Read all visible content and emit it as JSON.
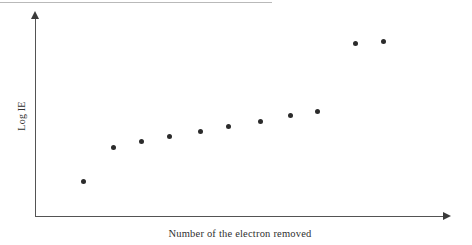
{
  "figure": {
    "top_rule_present": true,
    "background_color": "#ffffff",
    "axis_color": "#545454",
    "marker_color": "#2b2b2b"
  },
  "axes": {
    "y_label": "Log IE",
    "x_label": "Number of the electron removed",
    "y_axis_name": "vertical-axis",
    "x_axis_name": "horizontal-axis",
    "arrow_y": "y-axis-arrow",
    "arrow_x": "x-axis-arrow"
  },
  "chart_data": {
    "type": "scatter",
    "title": "",
    "subtitle": "",
    "xlabel": "Number of the electron removed",
    "ylabel": "Log IE",
    "grid": false,
    "legend": null,
    "xlim": [
      0,
      12
    ],
    "ylim": [
      0,
      10
    ],
    "x_tick_labels": [],
    "y_tick_labels": [],
    "annotations": [],
    "series": [
      {
        "name": "Log IE vs electron removed",
        "x": [
          1,
          2,
          3,
          4,
          5,
          6,
          7,
          8,
          9,
          10,
          11
        ],
        "y": [
          1.75,
          3.47,
          3.77,
          4.02,
          4.29,
          4.54,
          4.8,
          5.1,
          5.3,
          8.75,
          8.85
        ],
        "px": [
          {
            "cx": 83,
            "cy": 181
          },
          {
            "cx": 113,
            "cy": 147
          },
          {
            "cx": 141,
            "cy": 141
          },
          {
            "cx": 169,
            "cy": 136
          },
          {
            "cx": 200,
            "cy": 131
          },
          {
            "cx": 228,
            "cy": 126
          },
          {
            "cx": 260,
            "cy": 121
          },
          {
            "cx": 290,
            "cy": 115
          },
          {
            "cx": 317,
            "cy": 111
          },
          {
            "cx": 355,
            "cy": 43
          },
          {
            "cx": 383,
            "cy": 41
          }
        ]
      }
    ]
  }
}
